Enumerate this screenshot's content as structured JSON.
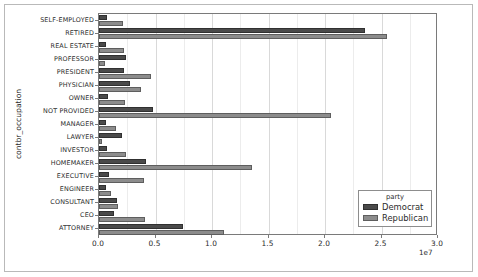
{
  "chart_data": {
    "type": "bar",
    "orientation": "horizontal",
    "title": "",
    "xlabel": "",
    "ylabel": "contbr_occupation",
    "x_exponent_label": "1e7",
    "xlim": [
      0.0,
      3.0
    ],
    "x_tick_labels": [
      "0.0",
      "0.5",
      "1.0",
      "1.5",
      "2.0",
      "2.5",
      "3.0"
    ],
    "x_tick_values": [
      0.0,
      0.5,
      1.0,
      1.5,
      2.0,
      2.5,
      3.0
    ],
    "x_scale_multiplier": 10000000,
    "grid": true,
    "legend_title": "party",
    "legend_position": "lower right",
    "categories": [
      "SELF-EMPLOYED",
      "RETIRED",
      "REAL ESTATE",
      "PROFESSOR",
      "PRESIDENT",
      "PHYSICIAN",
      "OWNER",
      "NOT PROVIDED",
      "MANAGER",
      "LAWYER",
      "INVESTOR",
      "HOMEMAKER",
      "EXECUTIVE",
      "ENGINEER",
      "CONSULTANT",
      "CEO",
      "ATTORNEY"
    ],
    "series": [
      {
        "name": "Democrat",
        "color": "#4a4a4a",
        "values": [
          0.07,
          2.35,
          0.06,
          0.24,
          0.22,
          0.27,
          0.08,
          0.48,
          0.06,
          0.2,
          0.07,
          0.42,
          0.09,
          0.06,
          0.16,
          0.13,
          0.74
        ]
      },
      {
        "name": "Republican",
        "color": "#8c8c8c",
        "values": [
          0.21,
          2.55,
          0.22,
          0.05,
          0.46,
          0.37,
          0.23,
          2.05,
          0.15,
          0.03,
          0.24,
          1.35,
          0.4,
          0.11,
          0.17,
          0.41,
          1.11
        ]
      }
    ]
  },
  "legend": {
    "title": "party",
    "entries": [
      {
        "label": "Democrat",
        "color": "#4a4a4a"
      },
      {
        "label": "Republican",
        "color": "#8c8c8c"
      }
    ]
  },
  "axis": {
    "y_title": "contbr_occupation",
    "x_exponent": "1e7"
  }
}
